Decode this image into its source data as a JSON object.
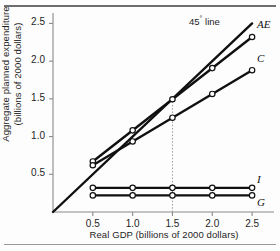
{
  "chart_data": {
    "type": "line",
    "title": "",
    "xlabel": "Real GDP (billions of 2000 dollars)",
    "ylabel_line1": "Aggregate planned expenditure",
    "ylabel_line2": "(billions of 2000 dollars)",
    "xlim": [
      0,
      2.75
    ],
    "ylim": [
      0,
      2.625
    ],
    "xticks": [
      0.5,
      1.0,
      1.5,
      2.0,
      2.5
    ],
    "xtick_labels": [
      "0.5",
      "1.0",
      "1.5",
      "2.0",
      "2.5"
    ],
    "yticks": [
      0.5,
      1.0,
      1.5,
      2.0,
      2.5
    ],
    "ytick_labels": [
      "0.5",
      "1.0",
      "1.5",
      "2.0",
      "2.5"
    ],
    "grid": false,
    "legend": "inline-right-endpoint-labels",
    "x": [
      0.5,
      1.0,
      1.5,
      2.0,
      2.5
    ],
    "series": [
      {
        "name": "AE",
        "label": "AE",
        "markers": true,
        "values": [
          0.67,
          1.08,
          1.5,
          1.92,
          2.32
        ]
      },
      {
        "name": "C",
        "label": "C",
        "markers": true,
        "values": [
          0.62,
          1.05,
          1.48,
          1.9,
          1.88
        ]
      },
      {
        "name": "I",
        "label": "I",
        "markers": true,
        "values": [
          0.32,
          0.32,
          0.32,
          0.32,
          0.32
        ]
      },
      {
        "name": "G",
        "label": "G",
        "markers": true,
        "values": [
          0.22,
          0.22,
          0.22,
          0.22,
          0.22
        ]
      }
    ],
    "reference_line": {
      "name": "45-degree-line",
      "label": "45",
      "label_suffix": " line",
      "degree_symbol": "°",
      "from": [
        0,
        0
      ],
      "to": [
        2.5,
        2.5
      ]
    },
    "annotations": [
      {
        "name": "equilibrium-dotted-line",
        "type": "vertical-dotted",
        "x": 1.5,
        "from_y": 0,
        "to_y": 1.5
      }
    ],
    "colors": {
      "line": "#101010",
      "axis": "#8a8a8a",
      "text": "#1d1d1d",
      "marker_fill": "#ffffff",
      "dotted": "#9a9a9a",
      "rule": "#6e6e6e",
      "background": "#fdfdfd"
    }
  }
}
